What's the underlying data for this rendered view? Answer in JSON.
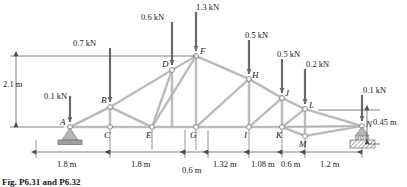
{
  "figure": {
    "caption": "Fig. P6.31 and P6.32",
    "type": "truss-diagram"
  },
  "colors": {
    "member_fill": "#c8c8c8",
    "member_edge": "#8a8a8a",
    "line": "#4d4d4d",
    "arrow": "#6b6b6b",
    "support": "#a0a0a0"
  },
  "loads": [
    {
      "id": "load-A",
      "label": "0.1 kN",
      "at_node": "A",
      "label_x": 44,
      "label_y": 92,
      "tip_x": 70,
      "tip_y": 127,
      "tail_y": 96
    },
    {
      "id": "load-B",
      "label": "0.7 kN",
      "at_node": "B",
      "label_x": 73,
      "label_y": 39,
      "tip_x": 110,
      "tip_y": 107,
      "tail_y": 48
    },
    {
      "id": "load-D",
      "label": "0.6 kN",
      "at_node": "D",
      "label_x": 141,
      "label_y": 13,
      "tip_x": 172,
      "tip_y": 70,
      "tail_y": 22
    },
    {
      "id": "load-F",
      "label": "1.3 kN",
      "at_node": "F",
      "label_x": 196,
      "label_y": 3,
      "tip_x": 196,
      "tip_y": 56,
      "tail_y": 12
    },
    {
      "id": "load-H",
      "label": "0.5 kN",
      "at_node": "H",
      "label_x": 245,
      "label_y": 31,
      "tip_x": 249,
      "tip_y": 79,
      "tail_y": 40
    },
    {
      "id": "load-J",
      "label": "0.5 kN",
      "at_node": "J",
      "label_x": 277,
      "label_y": 50,
      "tip_x": 282,
      "tip_y": 98,
      "tail_y": 59
    },
    {
      "id": "load-L",
      "label": "0.2 kN",
      "at_node": "L",
      "label_x": 306,
      "label_y": 60,
      "tip_x": 305,
      "tip_y": 109,
      "tail_y": 69
    },
    {
      "id": "load-N",
      "label": "0.1 kN",
      "at_node": "N",
      "label_x": 363,
      "label_y": 86,
      "tip_x": 362,
      "tip_y": 126,
      "tail_y": 95
    }
  ],
  "nodes": [
    {
      "id": "A",
      "label": "A",
      "x": 70,
      "y": 127,
      "lx": 60,
      "ly": 118
    },
    {
      "id": "B",
      "label": "B",
      "x": 110,
      "y": 107,
      "lx": 101,
      "ly": 96
    },
    {
      "id": "C",
      "label": "C",
      "x": 110,
      "y": 127,
      "lx": 104,
      "ly": 131
    },
    {
      "id": "D",
      "label": "D",
      "x": 172,
      "y": 70,
      "lx": 162,
      "ly": 60
    },
    {
      "id": "E",
      "label": "E",
      "x": 152,
      "y": 127,
      "lx": 146,
      "ly": 131
    },
    {
      "id": "F",
      "label": "F",
      "x": 196,
      "y": 56,
      "lx": 200,
      "ly": 47
    },
    {
      "id": "G",
      "label": "G",
      "x": 196,
      "y": 127,
      "lx": 190,
      "ly": 131
    },
    {
      "id": "H",
      "label": "H",
      "x": 249,
      "y": 79,
      "lx": 252,
      "ly": 71
    },
    {
      "id": "I",
      "label": "I",
      "x": 249,
      "y": 127,
      "lx": 244,
      "ly": 131
    },
    {
      "id": "J",
      "label": "J",
      "x": 282,
      "y": 98,
      "lx": 285,
      "ly": 89
    },
    {
      "id": "K",
      "label": "K",
      "x": 282,
      "y": 127,
      "lx": 276,
      "ly": 131
    },
    {
      "id": "L",
      "label": "L",
      "x": 305,
      "y": 109,
      "lx": 309,
      "ly": 101
    },
    {
      "id": "M",
      "label": "M",
      "x": 305,
      "y": 136,
      "lx": 299,
      "ly": 140
    },
    {
      "id": "N",
      "label": "N",
      "x": 362,
      "y": 126,
      "lx": 366,
      "ly": 120
    }
  ],
  "dimensions": {
    "vertical_left": {
      "label": "2.1 m",
      "x": 3,
      "y": 80
    },
    "vertical_right": {
      "label": "0.45 m",
      "x": 373,
      "y": 118
    },
    "horizontal": [
      {
        "label": "1.8 m",
        "x1": 36,
        "x2": 110,
        "label_x": 57,
        "label_y": 160
      },
      {
        "label": "1.8 m",
        "x1": 110,
        "x2": 185,
        "label_x": 131,
        "label_y": 160
      },
      {
        "label": "0.6 m",
        "x1": 185,
        "x2": 208,
        "label_x": 182,
        "label_y": 166
      },
      {
        "label": "1.32 m",
        "x1": 208,
        "x2": 249,
        "label_x": 213,
        "label_y": 160
      },
      {
        "label": "1.08 m",
        "x1": 249,
        "x2": 282,
        "label_x": 251,
        "label_y": 160
      },
      {
        "label": "0.6 m",
        "x1": 282,
        "x2": 305,
        "label_x": 281,
        "label_y": 160
      },
      {
        "label": "1.2 m",
        "x1": 305,
        "x2": 362,
        "label_x": 320,
        "label_y": 160
      }
    ]
  },
  "supports": [
    {
      "id": "support-pin",
      "node": "A",
      "kind": "pin"
    },
    {
      "id": "support-roller",
      "node": "N",
      "kind": "roller"
    }
  ]
}
